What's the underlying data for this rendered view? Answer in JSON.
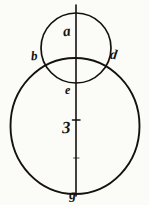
{
  "figure": {
    "canvas": {
      "width": 149,
      "height": 205,
      "background": "#fbfbf8"
    },
    "ink_color": "#14110f",
    "shapes": {
      "small_circle": {
        "name": "small-circle",
        "cx": 76,
        "cy": 48,
        "r": 35,
        "stroke_width": 1.6
      },
      "large_circle": {
        "name": "large-circle",
        "cx": 75,
        "cy": 126,
        "r": 64,
        "stroke_width": 1.9
      },
      "vertical_axis": {
        "name": "vertical-axis-line",
        "x": 76,
        "y1": 5,
        "y2": 196,
        "stroke_width": 1.6
      },
      "axis_tick": {
        "name": "axis-tick-mark",
        "x": 76,
        "y": 120,
        "length": 7
      }
    },
    "labels": [
      {
        "id": "a",
        "text": "a",
        "role": "small-circle-top-point",
        "x": 63,
        "y": 24
      },
      {
        "id": "b",
        "text": "b",
        "role": "left-intersection-point",
        "x": 31,
        "y": 49
      },
      {
        "id": "d",
        "text": "d",
        "role": "right-intersection-point",
        "x": 110,
        "y": 48
      },
      {
        "id": "e",
        "text": "e",
        "role": "small-circle-bottom-point",
        "x": 65,
        "y": 84
      },
      {
        "id": "z",
        "text": "3",
        "role": "large-circle-center-point",
        "x": 62,
        "y": 119
      },
      {
        "id": "g",
        "text": "g",
        "role": "large-circle-bottom-point",
        "x": 69,
        "y": 188
      }
    ]
  }
}
